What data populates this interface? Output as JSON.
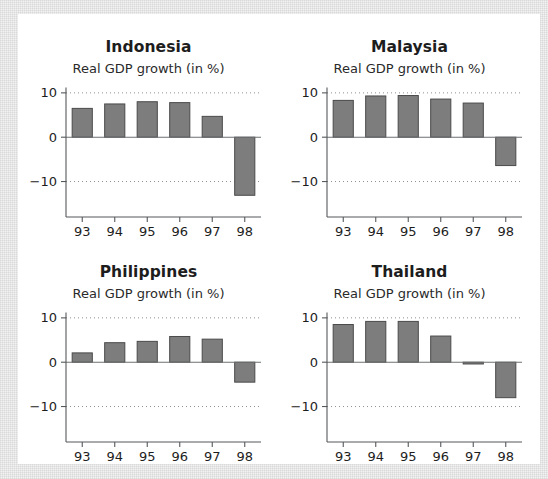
{
  "figure": {
    "subtitle_common": "Real GDP growth (in %)",
    "background_color": "#ffffff",
    "frame_color": "#f2f2f2",
    "bar_fill": "#7d7d7d",
    "bar_stroke": "#4a4a4a"
  },
  "chart_data": [
    {
      "type": "bar",
      "title": "Indonesia",
      "subtitle": "Real GDP growth (in %)",
      "xlabel": "",
      "ylabel": "",
      "categories": [
        "93",
        "94",
        "95",
        "96",
        "97",
        "98"
      ],
      "values": [
        6.5,
        7.5,
        8.0,
        7.8,
        4.7,
        -13.1
      ],
      "ylim": [
        -18,
        12
      ],
      "yticks": [
        10,
        0,
        -10
      ],
      "ytick_labels": [
        "10",
        "0",
        "−10"
      ],
      "gridlines": [
        10,
        -10
      ],
      "grid": true,
      "legend": "none"
    },
    {
      "type": "bar",
      "title": "Malaysia",
      "subtitle": "Real GDP growth (in %)",
      "xlabel": "",
      "ylabel": "",
      "categories": [
        "93",
        "94",
        "95",
        "96",
        "97",
        "98"
      ],
      "values": [
        8.3,
        9.3,
        9.4,
        8.6,
        7.7,
        -6.4
      ],
      "ylim": [
        -18,
        12
      ],
      "yticks": [
        10,
        0,
        -10
      ],
      "ytick_labels": [
        "10",
        "0",
        "−10"
      ],
      "gridlines": [
        10,
        -10
      ],
      "grid": true,
      "legend": "none"
    },
    {
      "type": "bar",
      "title": "Philippines",
      "subtitle": "Real GDP growth (in %)",
      "xlabel": "",
      "ylabel": "",
      "categories": [
        "93",
        "94",
        "95",
        "96",
        "97",
        "98"
      ],
      "values": [
        2.1,
        4.4,
        4.7,
        5.8,
        5.2,
        -4.5
      ],
      "ylim": [
        -18,
        12
      ],
      "yticks": [
        10,
        0,
        -10
      ],
      "ytick_labels": [
        "10",
        "0",
        "−10"
      ],
      "gridlines": [
        10,
        -10
      ],
      "grid": true,
      "legend": "none"
    },
    {
      "type": "bar",
      "title": "Thailand",
      "subtitle": "Real GDP growth (in %)",
      "xlabel": "",
      "ylabel": "",
      "categories": [
        "93",
        "94",
        "95",
        "96",
        "97",
        "98"
      ],
      "values": [
        8.5,
        9.2,
        9.2,
        5.9,
        -0.4,
        -8.0
      ],
      "ylim": [
        -18,
        12
      ],
      "yticks": [
        10,
        0,
        -10
      ],
      "ytick_labels": [
        "10",
        "0",
        "−10"
      ],
      "gridlines": [
        10,
        -10
      ],
      "grid": true,
      "legend": "none"
    }
  ]
}
